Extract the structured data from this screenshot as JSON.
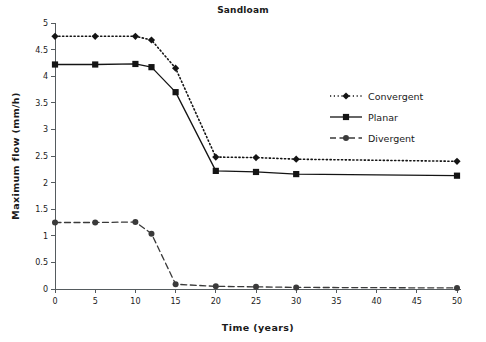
{
  "chart_data": {
    "type": "line",
    "title": "Sandloam",
    "xlabel": "Time (years)",
    "ylabel": "Maximum  flow  (mm/h)",
    "x": [
      0,
      5,
      10,
      12,
      15,
      20,
      25,
      30,
      50
    ],
    "xlim": [
      0,
      50
    ],
    "ylim": [
      0,
      5
    ],
    "xticks": [
      0,
      5,
      10,
      15,
      20,
      25,
      30,
      35,
      40,
      45,
      50
    ],
    "xticklabels": [
      "0",
      "5",
      "10",
      "15",
      "20",
      "25",
      "30",
      "35",
      "40",
      "45",
      "50"
    ],
    "yticks": [
      0,
      0.5,
      1,
      1.5,
      2,
      2.5,
      3,
      3.5,
      4,
      4.5,
      5
    ],
    "yticklabels": [
      "0",
      "0.5",
      "1",
      "1.5",
      "2",
      "2.5",
      "3",
      "3.5",
      "4",
      "4.5",
      "5"
    ],
    "grid": false,
    "legend_position": "upper right",
    "series": [
      {
        "name": "Convergent",
        "values": [
          4.75,
          4.75,
          4.75,
          4.68,
          4.15,
          2.48,
          2.47,
          2.44,
          2.4
        ],
        "linestyle": "dotted",
        "marker": "diamond",
        "color": "#141414"
      },
      {
        "name": "Planar",
        "values": [
          4.22,
          4.22,
          4.23,
          4.17,
          3.7,
          2.22,
          2.2,
          2.16,
          2.13
        ],
        "linestyle": "solid",
        "marker": "square",
        "color": "#141414"
      },
      {
        "name": "Divergent",
        "values": [
          1.25,
          1.25,
          1.26,
          1.04,
          0.09,
          0.05,
          0.04,
          0.03,
          0.02
        ],
        "linestyle": "dashed",
        "marker": "circle",
        "color": "#3a3a3a"
      }
    ]
  },
  "legend": {
    "entries": [
      {
        "label": "Convergent"
      },
      {
        "label": "Planar"
      },
      {
        "label": "Divergent"
      }
    ]
  }
}
